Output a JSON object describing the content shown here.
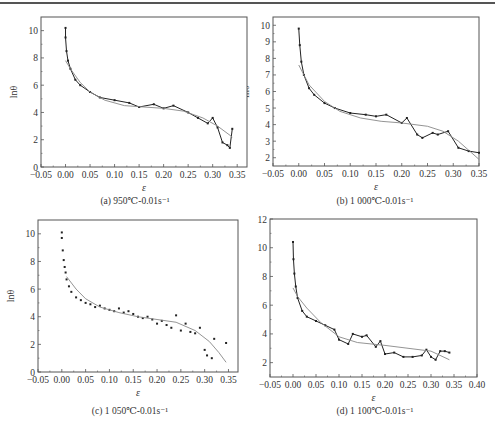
{
  "figure": {
    "panels": [
      {
        "id": "a",
        "caption": "(a) 950℃-0.01s⁻¹",
        "xlabel": "ε",
        "ylabel": "lnθ"
      },
      {
        "id": "b",
        "caption": "(b) 1 000℃-0.01s⁻¹",
        "xlabel": "ε",
        "ylabel": "lnθ"
      },
      {
        "id": "c",
        "caption": "(c) 1 050℃-0.01s⁻¹",
        "xlabel": "ε",
        "ylabel": "lnθ"
      },
      {
        "id": "d",
        "caption": "(d) 1 100℃-0.01s⁻¹",
        "xlabel": "ε",
        "ylabel": "lnθ"
      }
    ]
  },
  "chart_data": [
    {
      "type": "line",
      "title": "(a) 950℃-0.01s⁻¹",
      "xlabel": "ε",
      "ylabel": "lnθ",
      "xlim": [
        -0.05,
        0.37
      ],
      "ylim": [
        0,
        11
      ],
      "xticks": [
        "-0.05",
        "0.00",
        "0.05",
        "0.10",
        "0.15",
        "0.20",
        "0.25",
        "0.30",
        "0.35"
      ],
      "yticks": [
        "0",
        "2",
        "4",
        "6",
        "8",
        "10"
      ],
      "grid": false,
      "series": [
        {
          "name": "measured",
          "x": [
            0.0,
            0.0,
            0.002,
            0.005,
            0.01,
            0.02,
            0.03,
            0.05,
            0.07,
            0.1,
            0.13,
            0.15,
            0.18,
            0.2,
            0.22,
            0.25,
            0.27,
            0.29,
            0.3,
            0.31,
            0.32,
            0.33,
            0.335,
            0.34
          ],
          "y": [
            10.2,
            9.5,
            8.5,
            7.8,
            7.2,
            6.4,
            6.0,
            5.5,
            5.1,
            4.9,
            4.7,
            4.4,
            4.6,
            4.3,
            4.5,
            4.0,
            3.6,
            3.2,
            3.6,
            2.9,
            1.8,
            1.6,
            1.4,
            2.8
          ]
        },
        {
          "name": "fit",
          "x": [
            0.0,
            0.01,
            0.03,
            0.05,
            0.08,
            0.12,
            0.16,
            0.2,
            0.24,
            0.28,
            0.31,
            0.34
          ],
          "y": [
            7.8,
            7.2,
            6.2,
            5.5,
            4.9,
            4.5,
            4.4,
            4.3,
            4.1,
            3.6,
            3.0,
            2.2
          ]
        }
      ]
    },
    {
      "type": "line",
      "title": "(b) 1 000℃-0.01s⁻¹",
      "xlabel": "ε",
      "ylabel": "lnθ",
      "xlim": [
        -0.05,
        0.35
      ],
      "ylim": [
        1.5,
        10.5
      ],
      "xticks": [
        "-0.05",
        "0.00",
        "0.05",
        "0.10",
        "0.15",
        "0.20",
        "0.25",
        "0.30",
        "0.35"
      ],
      "yticks": [
        "2",
        "3",
        "4",
        "5",
        "6",
        "7",
        "8",
        "9",
        "10"
      ],
      "grid": false,
      "series": [
        {
          "name": "measured",
          "x": [
            0.0,
            0.002,
            0.005,
            0.01,
            0.02,
            0.03,
            0.05,
            0.07,
            0.1,
            0.13,
            0.15,
            0.17,
            0.2,
            0.21,
            0.23,
            0.24,
            0.26,
            0.27,
            0.29,
            0.31,
            0.33,
            0.35
          ],
          "y": [
            9.8,
            8.8,
            7.8,
            7.0,
            6.2,
            5.8,
            5.3,
            5.0,
            4.7,
            4.6,
            4.5,
            4.6,
            4.1,
            4.4,
            3.4,
            3.2,
            3.5,
            3.4,
            3.6,
            2.6,
            2.4,
            2.3
          ]
        },
        {
          "name": "fit",
          "x": [
            0.0,
            0.02,
            0.05,
            0.08,
            0.12,
            0.16,
            0.2,
            0.25,
            0.28,
            0.31,
            0.35
          ],
          "y": [
            7.6,
            6.4,
            5.4,
            4.8,
            4.4,
            4.2,
            4.1,
            3.9,
            3.6,
            3.0,
            1.9
          ]
        }
      ]
    },
    {
      "type": "scatter",
      "title": "(c) 1 050℃-0.01s⁻¹",
      "xlabel": "ε",
      "ylabel": "lnθ",
      "xlim": [
        -0.05,
        0.37
      ],
      "ylim": [
        0,
        11
      ],
      "xticks": [
        "-0.05",
        "0.00",
        "0.05",
        "0.10",
        "0.15",
        "0.20",
        "0.25",
        "0.30",
        "0.35"
      ],
      "yticks": [
        "0",
        "2",
        "4",
        "6",
        "8",
        "10"
      ],
      "grid": false,
      "series": [
        {
          "name": "measured",
          "x": [
            0.0,
            0.0,
            0.002,
            0.004,
            0.006,
            0.008,
            0.01,
            0.015,
            0.02,
            0.03,
            0.04,
            0.05,
            0.06,
            0.07,
            0.08,
            0.09,
            0.1,
            0.11,
            0.12,
            0.13,
            0.14,
            0.15,
            0.16,
            0.17,
            0.18,
            0.19,
            0.2,
            0.21,
            0.22,
            0.23,
            0.24,
            0.25,
            0.26,
            0.27,
            0.28,
            0.29,
            0.3,
            0.305,
            0.315,
            0.32,
            0.345
          ],
          "y": [
            10.1,
            9.7,
            8.8,
            8.1,
            7.6,
            7.2,
            6.7,
            6.2,
            5.8,
            5.4,
            5.2,
            5.0,
            4.9,
            4.7,
            4.8,
            4.6,
            4.5,
            4.4,
            4.6,
            4.3,
            4.4,
            4.2,
            4.0,
            3.9,
            4.0,
            3.8,
            3.5,
            3.7,
            3.4,
            3.2,
            4.1,
            3.0,
            3.5,
            2.9,
            2.8,
            3.2,
            1.6,
            1.2,
            1.0,
            2.4,
            2.1
          ]
        },
        {
          "name": "fit",
          "x": [
            0.01,
            0.03,
            0.05,
            0.08,
            0.12,
            0.16,
            0.2,
            0.24,
            0.28,
            0.31,
            0.33,
            0.345
          ],
          "y": [
            6.9,
            6.0,
            5.3,
            4.7,
            4.3,
            4.0,
            3.8,
            3.6,
            3.0,
            2.2,
            1.4,
            0.7
          ]
        }
      ]
    },
    {
      "type": "line",
      "title": "(d) 1 100℃-0.01s⁻¹",
      "xlabel": "ε",
      "ylabel": "lnθ",
      "xlim": [
        -0.05,
        0.4
      ],
      "ylim": [
        1,
        12
      ],
      "xticks": [
        "-0.05",
        "0.00",
        "0.05",
        "0.10",
        "0.15",
        "0.20",
        "0.25",
        "0.30",
        "0.35",
        "0.40"
      ],
      "yticks": [
        "2",
        "4",
        "6",
        "8",
        "10",
        "12"
      ],
      "grid": false,
      "series": [
        {
          "name": "measured",
          "x": [
            0.0,
            0.001,
            0.003,
            0.006,
            0.01,
            0.02,
            0.03,
            0.05,
            0.07,
            0.09,
            0.1,
            0.12,
            0.13,
            0.15,
            0.16,
            0.18,
            0.19,
            0.2,
            0.22,
            0.24,
            0.26,
            0.28,
            0.29,
            0.3,
            0.31,
            0.32,
            0.33,
            0.34
          ],
          "y": [
            10.4,
            9.2,
            8.2,
            7.3,
            6.5,
            5.6,
            5.2,
            4.9,
            4.6,
            4.3,
            3.6,
            3.3,
            4.0,
            3.8,
            3.9,
            3.1,
            3.5,
            2.6,
            2.7,
            2.4,
            2.4,
            2.5,
            2.9,
            2.4,
            2.2,
            2.8,
            2.8,
            2.7
          ]
        },
        {
          "name": "fit",
          "x": [
            0.0,
            0.01,
            0.03,
            0.06,
            0.1,
            0.14,
            0.2,
            0.25,
            0.3,
            0.34
          ],
          "y": [
            7.2,
            6.6,
            5.8,
            4.8,
            3.8,
            3.4,
            3.2,
            3.0,
            2.8,
            2.2
          ]
        }
      ]
    }
  ]
}
